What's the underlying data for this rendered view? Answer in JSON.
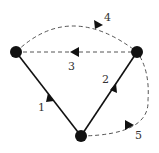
{
  "diagram": {
    "nodes": [
      {
        "id": "A",
        "x": 16,
        "y": 52
      },
      {
        "id": "B",
        "x": 137,
        "y": 52
      },
      {
        "id": "C",
        "x": 81,
        "y": 136
      }
    ],
    "edges": [
      {
        "label": "1",
        "from": "C",
        "to": "A",
        "style": "solid"
      },
      {
        "label": "2",
        "from": "C",
        "to": "B",
        "style": "solid"
      },
      {
        "label": "3",
        "from": "B",
        "to": "A",
        "style": "dashed"
      },
      {
        "label": "4",
        "from": "A",
        "to": "B",
        "style": "dashed",
        "curved": true
      },
      {
        "label": "5",
        "from": "C",
        "to": "B",
        "style": "dashed",
        "curved": true
      }
    ],
    "colors": {
      "line": "#111111",
      "dashed": "#555555"
    }
  }
}
